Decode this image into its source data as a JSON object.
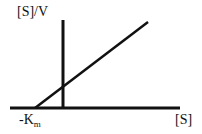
{
  "diagram": {
    "type": "Hanes-Woolf plot",
    "y_axis_label": "[S]/V",
    "x_axis_label": "[S]",
    "intercept_label": {
      "main": "-K",
      "sub": "m"
    },
    "line_color": "#111111"
  }
}
